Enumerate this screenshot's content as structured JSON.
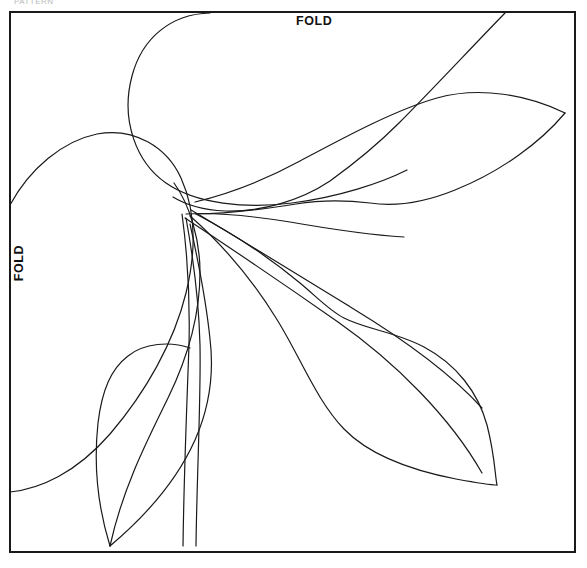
{
  "document": {
    "type": "applique-pattern-template",
    "title_partial": "PATTERN",
    "background_color": "#ffffff",
    "line_color": "#1a1a1a",
    "border_color": "#1a1a1a"
  },
  "labels": {
    "fold_top": "FOLD",
    "fold_left": "FOLD"
  },
  "frame": {
    "x": 10,
    "y": 12,
    "width": 565,
    "height": 540,
    "stroke_width": 2
  },
  "shapes": {
    "stroke_width": 1.2,
    "paths": [
      {
        "name": "top-large-petal",
        "d": "M 210 13 C 171 14 142 38 132 76 C 120 121 137 163 166 183 C 196 204 246 209 292 203 C 339 197 381 183 407 170"
      },
      {
        "name": "top-petal-outer-sweep",
        "d": "M 505 13 C 470 49 430 92 399 123 C 372 150 348 168 330 181 C 300 201 261 212 225 211 C 203 210 186 205 173 197"
      },
      {
        "name": "right-leaf-upper",
        "d": "M 195 202 C 228 194 265 180 300 161 C 345 137 395 110 437 98 C 480 86 528 95 565 113"
      },
      {
        "name": "right-leaf-lower",
        "d": "M 565 113 C 540 143 500 172 455 190 C 418 205 390 206 370 203 C 345 200 320 200 296 204 C 265 209 228 214 196 214"
      },
      {
        "name": "stem-inner-upper",
        "d": "M 186 214 C 215 212 252 216 290 222 C 330 229 370 235 404 237"
      },
      {
        "name": "center-leaf-spine-upper",
        "d": "M 191 210 C 240 239 300 276 352 308 C 408 342 452 375 482 408"
      },
      {
        "name": "center-leaf-spine-lower",
        "d": "M 185 218 C 232 249 288 287 338 322 C 395 362 450 417 482 473"
      },
      {
        "name": "lower-right-leaf-upper",
        "d": "M 196 214 C 230 232 270 258 300 283 C 318 298 330 311 344 318 C 365 329 396 332 424 347 C 456 364 478 392 487 425 C 495 456 495 476 497 485"
      },
      {
        "name": "lower-right-leaf-lower",
        "d": "M 190 216 C 222 244 253 281 276 318 C 300 356 316 400 344 429 C 373 459 420 472 456 479 C 478 483 492 485 497 485"
      },
      {
        "name": "left-large-petal",
        "d": "M 10 205 C 30 168 63 141 97 134 C 134 127 167 147 181 178 C 196 211 196 252 186 293 C 174 342 146 392 110 434 C 76 473 40 489 10 492"
      },
      {
        "name": "left-inner-petal",
        "d": "M 174 183 C 190 205 200 240 200 272 C 200 311 189 355 168 398 C 147 441 123 487 110 546"
      },
      {
        "name": "lower-left-leaf-left",
        "d": "M 110 546 C 97 504 94 460 98 423 C 102 390 111 369 128 356 C 144 343 170 341 190 348"
      },
      {
        "name": "lower-left-leaf-right",
        "d": "M 110 546 C 148 514 178 478 195 440 C 210 406 214 372 210 339 C 206 300 198 260 190 224"
      },
      {
        "name": "stem-rib-inner",
        "d": "M 186 218 C 194 262 199 305 200 345 C 201 400 197 470 196 546"
      },
      {
        "name": "stem-rib-outer",
        "d": "M 182 214 C 188 258 190 302 189 345 C 187 402 184 470 183 546"
      }
    ]
  }
}
